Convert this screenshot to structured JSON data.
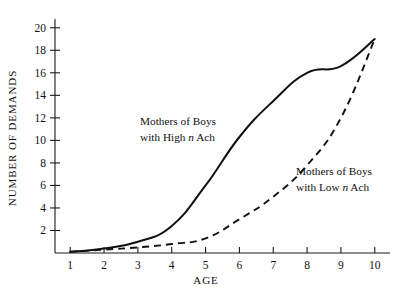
{
  "chart_data": {
    "type": "line",
    "title": "",
    "xlabel": "AGE",
    "ylabel": "NUMBER OF DEMANDS",
    "x": [
      1,
      2,
      3,
      4,
      5,
      6,
      7,
      8,
      9,
      10
    ],
    "xticklabels": [
      "1",
      "2",
      "3",
      "4",
      "5",
      "6",
      "7",
      "8",
      "9",
      "10"
    ],
    "yticklabels": [
      "2",
      "4",
      "6",
      "8",
      "10",
      "12",
      "14",
      "16",
      "18",
      "20"
    ],
    "yticks": [
      2,
      4,
      6,
      8,
      10,
      12,
      14,
      16,
      18,
      20
    ],
    "xlim": [
      0.55,
      10.45
    ],
    "ylim": [
      0,
      20.6
    ],
    "grid": false,
    "legend_position": "inline-annotations",
    "series": [
      {
        "name": "Mothers of Boys with High n Ach",
        "style": "solid",
        "values": [
          0.1,
          0.4,
          1.0,
          2.4,
          6.0,
          10.3,
          13.5,
          16.0,
          16.6,
          19.0
        ]
      },
      {
        "name": "Mothers of Boys with Low n Ach",
        "style": "dashed",
        "values": [
          0.1,
          0.3,
          0.5,
          0.8,
          1.3,
          3.0,
          5.0,
          7.8,
          12.0,
          19.0
        ]
      }
    ],
    "annotations": [
      {
        "id": "high",
        "line1": "Mothers of  Boys",
        "line2_pre": "with  High ",
        "line2_italic": "n",
        "line2_post": " Ach"
      },
      {
        "id": "low",
        "line1": "Mothers of  Boys",
        "line2_pre": "with  Low ",
        "line2_italic": "n",
        "line2_post": " Ach"
      }
    ],
    "colors": {
      "axis": "#1a1a1a",
      "series_solid": "#111111",
      "series_dashed": "#111111",
      "background": "#fefefe"
    }
  }
}
